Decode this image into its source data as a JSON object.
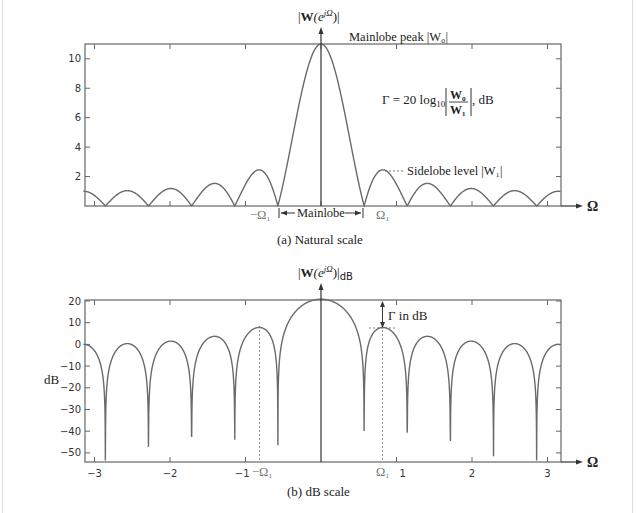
{
  "chart_data": [
    {
      "type": "line",
      "title": "(a) Natural scale",
      "ylabel": "|W(e^{jΩ})|",
      "xlabel": "Ω",
      "window_length": 11,
      "xlim": [
        -3.14159,
        3.14159
      ],
      "ylim": [
        0,
        11
      ],
      "yticks": [
        2,
        4,
        6,
        8,
        10
      ],
      "xticks_minor": [
        -3,
        -2,
        -1,
        0,
        1,
        2,
        3
      ],
      "grid": false,
      "series": [
        {
          "name": "|W(e^{jΩ})|",
          "formula": "|sin(11Ω/2)/sin(Ω/2)|",
          "x": [
            -3.14,
            -2.856,
            -2.57,
            -2.285,
            -2.0,
            -1.714,
            -1.43,
            -1.142,
            -0.82,
            -0.571,
            -0.3,
            0,
            0.3,
            0.571,
            0.82,
            1.142,
            1.43,
            1.714,
            2.0,
            2.285,
            2.57,
            2.856,
            3.14
          ],
          "y": [
            1.0,
            0,
            1.05,
            0,
            1.2,
            0,
            1.5,
            0,
            2.4,
            0,
            7.2,
            11,
            7.2,
            0,
            2.4,
            0,
            1.5,
            0,
            1.2,
            0,
            1.05,
            0,
            1.0
          ]
        }
      ],
      "annotations": {
        "peak_label": "Mainlobe peak |W₀|",
        "sidelobe_label": "Sidelobe level |W₁|",
        "formula_lhs": "Γ = 20 log",
        "formula_sub": "10",
        "formula_num": "W₀",
        "formula_den": "W₁",
        "formula_unit": ", dB",
        "mainlobe_label": "Mainlobe",
        "neg_omega1": "−Ω₁",
        "pos_omega1": "Ω₁"
      }
    },
    {
      "type": "line",
      "title": "(b) dB scale",
      "ylabel": "dB",
      "top_label": "|W(e^{jΩ})|dB",
      "xlabel": "Ω",
      "xlim": [
        -3.14159,
        3.14159
      ],
      "ylim": [
        -53.5,
        20.8
      ],
      "yticks": [
        20,
        10,
        0,
        -10,
        -20,
        -30,
        -40,
        -50
      ],
      "xticks": [
        -3,
        -2,
        -1,
        1,
        2,
        3
      ],
      "grid": false,
      "series": [
        {
          "name": "20log10|W(e^{jΩ})|",
          "peak_db": 20.8,
          "first_sidelobe_db": 7.6,
          "null_floor_db": -53.5
        }
      ],
      "annotations": {
        "gamma_label": "Γ in dB",
        "neg_omega1": "−Ω₁",
        "pos_omega1": "Ω₁"
      }
    }
  ],
  "labels": {
    "top_axis_W": "W",
    "top_axis_e": "(e",
    "top_axis_exp": "jΩ",
    "top_axis_close": ")|",
    "bottom_axis_sub": "dB",
    "omega": "Ω",
    "caption_a": "(a) Natural scale",
    "caption_b": "(b) dB scale",
    "ytick_a": [
      "10",
      "8",
      "6",
      "4",
      "2"
    ],
    "ytick_b": [
      "20",
      "10",
      "0",
      "−10",
      "−20",
      "−30",
      "−40",
      "−50"
    ],
    "xtick_b": [
      "−3",
      "−2",
      "−1",
      "1",
      "2",
      "3"
    ]
  },
  "colors": {
    "curve": "#6a6a6a",
    "axis": "#555555",
    "text": "#222222",
    "omega1_text": "#777777"
  }
}
